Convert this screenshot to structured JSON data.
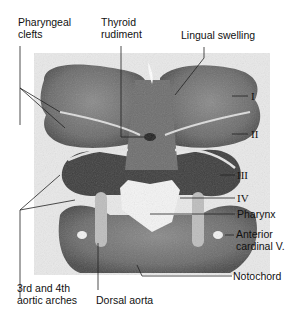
{
  "figure": {
    "type": "histological section"
  },
  "labels": {
    "pharyngeal_clefts": [
      "Pharyngeal",
      "clefts"
    ],
    "thyroid_rudiment": [
      "Thyroid",
      "rudiment"
    ],
    "lingual_swelling": "Lingual swelling",
    "arch_I": "I",
    "arch_II": "II",
    "arch_III": "III",
    "arch_IV": "IV",
    "pharynx": "Pharynx",
    "anterior_cardinal": [
      "Anterior",
      "cardinal V."
    ],
    "notochord": "Notochord",
    "aortic_arches": [
      "3rd and 4th",
      "aortic arches"
    ],
    "dorsal_aorta": "Dorsal aorta"
  }
}
